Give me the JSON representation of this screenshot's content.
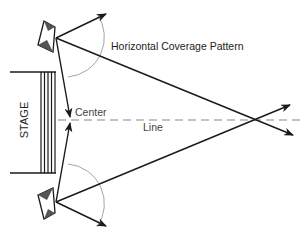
{
  "diagram": {
    "labels": {
      "coverage": "Horizontal Coverage Pattern",
      "center_line_1": "Center",
      "center_line_2": "Line",
      "stage": "STAGE"
    },
    "colors": {
      "line": "#1a1a1a",
      "dash": "#888888",
      "speaker_fill": "#555555",
      "arc": "#999999"
    }
  }
}
